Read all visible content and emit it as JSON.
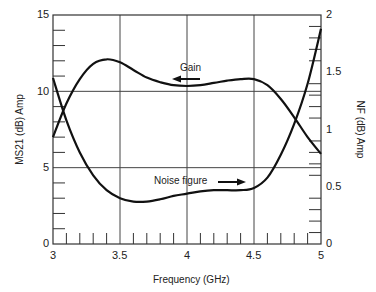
{
  "chart_data": {
    "type": "line",
    "title": "",
    "xlabel": "Frequency (GHz)",
    "ylabel": "MS21 (dB) Amp",
    "ylabel_right": "NF (dB) Amp",
    "xlim": [
      3,
      5
    ],
    "ylim": [
      0,
      15
    ],
    "ylim_right": [
      0,
      2
    ],
    "x_ticks": [
      "3",
      "3.5",
      "4",
      "4.5",
      "5"
    ],
    "y_ticks_left": [
      "0",
      "5",
      "10",
      "15"
    ],
    "y_ticks_right": [
      "0",
      "0.5",
      "1",
      "1.5",
      "2"
    ],
    "grid": true,
    "legend": "none (inline annotations)",
    "x": [
      3.0,
      3.1,
      3.2,
      3.3,
      3.4,
      3.5,
      3.6,
      3.7,
      3.8,
      3.9,
      4.0,
      4.1,
      4.2,
      4.3,
      4.4,
      4.5,
      4.6,
      4.7,
      4.8,
      4.9,
      5.0
    ],
    "series": [
      {
        "name": "Gain",
        "axis": "left",
        "values": [
          7.0,
          9.2,
          10.8,
          11.8,
          12.1,
          11.9,
          11.4,
          10.9,
          10.6,
          10.4,
          10.35,
          10.4,
          10.55,
          10.7,
          10.8,
          10.8,
          10.4,
          9.5,
          8.3,
          7.0,
          5.9
        ]
      },
      {
        "name": "Noise figure",
        "axis": "right",
        "values": [
          1.45,
          1.08,
          0.8,
          0.6,
          0.47,
          0.4,
          0.37,
          0.37,
          0.39,
          0.42,
          0.44,
          0.46,
          0.47,
          0.47,
          0.47,
          0.49,
          0.58,
          0.78,
          1.05,
          1.4,
          1.88
        ]
      }
    ],
    "annotations": [
      {
        "text": "Gain",
        "arrow": "left",
        "x": 4.05,
        "y_left": 11.5
      },
      {
        "text": "Noise figure",
        "arrow": "right",
        "x": 4.05,
        "y_right": 0.58
      }
    ]
  },
  "labels": {
    "x_title": "Frequency (GHz)",
    "y_left_title": "MS21 (dB) Amp",
    "y_right_title": "NF (dB) Amp",
    "gain_annotation": "Gain",
    "nf_annotation": "Noise figure",
    "x_ticks": [
      "3",
      "3.5",
      "4",
      "4.5",
      "5"
    ],
    "y_left_ticks": [
      "0",
      "5",
      "10",
      "15"
    ],
    "y_right_ticks": [
      "0",
      "0.5",
      "1",
      "1.5",
      "2"
    ]
  },
  "colors": {
    "line": "#111111",
    "grid": "#444444",
    "text": "#222222"
  }
}
